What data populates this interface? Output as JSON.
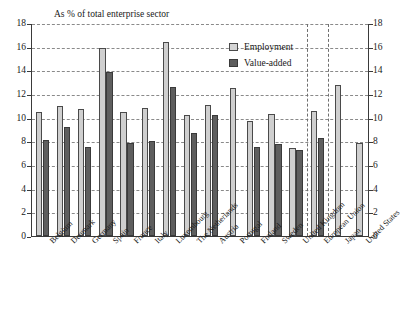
{
  "chart_data": {
    "type": "bar",
    "title": "As % of total enterprise sector",
    "xlabel": "",
    "ylabel": "",
    "ylim": [
      0,
      18
    ],
    "yticks": [
      0,
      2,
      4,
      6,
      8,
      10,
      12,
      14,
      16,
      18
    ],
    "grid": true,
    "legend_position": "top-right",
    "categories": [
      "Belgium",
      "Denmark",
      "Germany",
      "Spain",
      "France",
      "Italy",
      "Luxembourg",
      "The Netherlands",
      "Austria",
      "Portugal",
      "Finland",
      "Sweden",
      "United Kingdom",
      "European Union",
      "Japan",
      "United States"
    ],
    "series": [
      {
        "name": "Employment",
        "color": "#cfcfcf",
        "values": [
          10.5,
          11.0,
          10.7,
          15.9,
          10.5,
          10.8,
          16.4,
          10.2,
          11.1,
          12.5,
          9.75,
          10.3,
          7.4,
          10.6,
          12.8,
          7.9
        ]
      },
      {
        "name": "Value-added",
        "color": "#5e5e5e",
        "values": [
          8.15,
          9.2,
          7.55,
          13.9,
          7.9,
          8.0,
          12.6,
          8.7,
          10.2,
          null,
          7.5,
          7.8,
          7.3,
          8.25,
          null,
          null
        ]
      }
    ],
    "separators_after": [
      "United Kingdom",
      "European Union"
    ]
  },
  "legend": {
    "items": [
      {
        "label": "Employment",
        "key": "employment"
      },
      {
        "label": "Value-added",
        "key": "value"
      }
    ]
  }
}
